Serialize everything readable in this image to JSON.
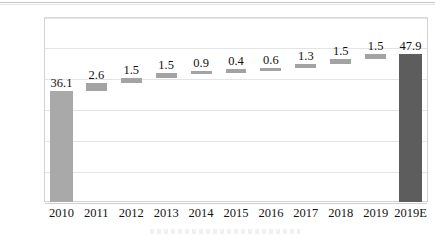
{
  "chart_data": {
    "type": "bar",
    "chart_style": "waterfall",
    "title": "",
    "subtitle": "",
    "xlabel": "",
    "ylabel": "",
    "ylim": [
      0,
      60
    ],
    "yticks": [
      0,
      10,
      20,
      30,
      40,
      50,
      60
    ],
    "ytick_labels": [
      "0",
      "10",
      "20",
      "30",
      "40",
      "50",
      "60"
    ],
    "grid": true,
    "legend": null,
    "categories": [
      "2010",
      "2011",
      "2012",
      "2013",
      "2014",
      "2015",
      "2016",
      "2017",
      "2018",
      "2019",
      "2019E"
    ],
    "values": [
      36.1,
      2.6,
      1.5,
      1.5,
      0.9,
      0.4,
      0.6,
      1.3,
      1.5,
      1.5,
      47.9
    ],
    "data_labels": [
      "36.1",
      "2.6",
      "1.5",
      "1.5",
      "0.9",
      "0.4",
      "0.6",
      "1.3",
      "1.5",
      "1.5",
      "47.9"
    ],
    "bar_kinds": [
      "start",
      "delta",
      "delta",
      "delta",
      "delta",
      "delta",
      "delta",
      "delta",
      "delta",
      "delta",
      "total"
    ],
    "cumulative_base": [
      0,
      36.1,
      38.7,
      40.2,
      41.7,
      42.6,
      43.0,
      43.6,
      44.9,
      46.4,
      0
    ],
    "cumulative_top": [
      36.1,
      38.7,
      40.2,
      41.7,
      42.6,
      43.0,
      43.6,
      44.9,
      46.4,
      47.9,
      47.9
    ],
    "colors": {
      "start_bar": "#a9a9a9",
      "delta_bar": "#a3a3a3",
      "total_bar": "#5d5d5d",
      "gridline": "#e4e4e4",
      "plot_border": "#d3d3d3",
      "text": "#141414",
      "background": "#ffffff"
    }
  }
}
